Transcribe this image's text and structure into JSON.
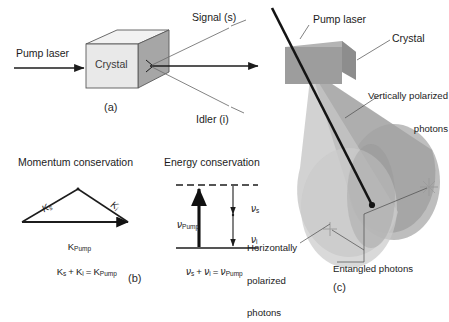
{
  "figure": {
    "title_semantic": "spontaneous-parametric-down-conversion-spdc-diagram",
    "background_color": "#ffffff",
    "ink_color": "#1c1c1c",
    "panels": [
      {
        "id": "a",
        "label": "(a)",
        "name": "crystal-beam-schematic"
      },
      {
        "id": "b",
        "label": "(b)",
        "name": "momentum-conservation"
      },
      {
        "id": "c",
        "label": "(c)",
        "name": "polarization-cones"
      }
    ]
  },
  "panel_a": {
    "pump_label": "Pump laser",
    "crystal_label": "Crystal",
    "signal_label": "Signal (s)",
    "idler_label": "Idler (i)",
    "panel_id": "(a)",
    "crystal_front_color": "#e8e8e8",
    "crystal_top_color": "#f2f2f2",
    "crystal_side_color": "#9a9a9a"
  },
  "panel_b": {
    "heading": "Momentum conservation",
    "vector_signal": "K",
    "vector_signal_sub": "s",
    "vector_idler": "K",
    "vector_idler_sub": "i",
    "vector_pump": "K",
    "vector_pump_sub": "Pump",
    "equation_parts": {
      "k": "K",
      "sub_s": "s",
      "sub_i": "i",
      "sub_pump": "Pump",
      "plus": "+",
      "equals": "="
    },
    "equation_text": "K s + K i = K Pump",
    "panel_id": "(b)"
  },
  "panel_b_energy": {
    "heading": "Energy conservation",
    "nu_symbol": "ν",
    "pump_sub": "Pump",
    "signal_sub": "s",
    "idler_sub": "i",
    "equation_text": "ν s + ν i = ν Pump"
  },
  "panel_c": {
    "pump_label": "Pump laser",
    "crystal_label": "Crystal",
    "vertical_label_line1": "Vertically polarized",
    "vertical_label_line2": "photons",
    "horizontal_label_line1": "Horizontally",
    "horizontal_label_line2": "polarized",
    "horizontal_label_line3": "photons",
    "entangled_label": "Entangled photons",
    "panel_id": "(c)",
    "cone_color_v": "#9e9e9e",
    "cone_color_h": "#c9c9c9",
    "crystal_color": "#9b9b9b",
    "beam_color": "#1a1a1a"
  }
}
